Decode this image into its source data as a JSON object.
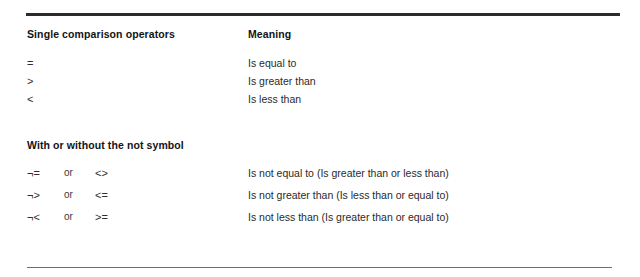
{
  "document": {
    "title": "Comparison Operators Reference",
    "background_color": "#ffffff",
    "text_color": "#2a2a2a",
    "rule_color_top": "#2b2b2b",
    "rule_color_bottom": "#6e6e6e"
  },
  "sections": [
    {
      "id": "single-comparison-operators",
      "heading_left": "Single comparison operators",
      "heading_right": "Meaning",
      "rows": [
        {
          "operator": "=",
          "conjunction": "",
          "alternate": "",
          "meaning": "Is equal to"
        },
        {
          "operator": ">",
          "conjunction": "",
          "alternate": "",
          "meaning": "Is greater than"
        },
        {
          "operator": "<",
          "conjunction": "",
          "alternate": "",
          "meaning": "Is less than"
        }
      ]
    },
    {
      "id": "with-or-without-not-symbol",
      "heading_left": "With or without the not symbol",
      "heading_right": "",
      "rows": [
        {
          "operator": "¬=",
          "conjunction": "or",
          "alternate": "<>",
          "meaning": "Is not equal to (Is greater than or less than)"
        },
        {
          "operator": "¬>",
          "conjunction": "or",
          "alternate": "<=",
          "meaning": "Is not greater than (Is less than or equal to)"
        },
        {
          "operator": "¬<",
          "conjunction": "or",
          "alternate": ">=",
          "meaning": "Is not less than (Is greater than or equal to)"
        }
      ]
    }
  ]
}
